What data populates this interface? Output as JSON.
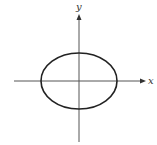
{
  "figure": {
    "type": "ellipse-on-axes",
    "x_axis_label": "x",
    "y_axis_label": "y",
    "shape": "ellipse",
    "center": "origin",
    "orientation": "horizontal major axis"
  },
  "colors": {
    "curve": "#222222",
    "axis": "#555555",
    "background": "#ffffff"
  }
}
